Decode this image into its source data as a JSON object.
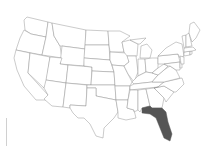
{
  "map": {
    "title": "",
    "region": "United States (contiguous)",
    "highlighted_states": [
      "Florida"
    ],
    "colors": {
      "background": "#ffffff",
      "state_fill": "#ffffff",
      "state_stroke": "#8a8a8a",
      "highlight_fill": "#555555",
      "legend_bar": "#d0d0d0"
    }
  }
}
